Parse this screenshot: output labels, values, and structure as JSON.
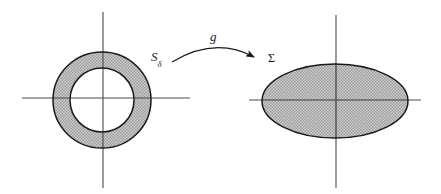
{
  "figure": {
    "kind": "mathematical-diagram",
    "background_color": "#ffffff",
    "width": 441,
    "height": 194,
    "caption_text": "",
    "labels": {
      "source_symbol": "S",
      "source_subscript": "δ",
      "map_symbol": "g",
      "target_symbol": "Σ"
    },
    "colors": {
      "stroke": "#1a1a1a",
      "axis": "#4a4a4a",
      "fill_gray": "#b4b4b4",
      "fill_gray_light": "#c9c9c9",
      "hatch_dot": "#8c8c8c"
    },
    "left_shape": {
      "name": "annulus",
      "center_x": 102,
      "center_y": 100,
      "outer_rx": 49,
      "outer_ry": 48,
      "inner_rx": 32,
      "inner_ry": 32,
      "filled": true,
      "inner_filled": false
    },
    "left_axes": {
      "horizontal": {
        "x1": 22,
        "y1": 98,
        "x2": 190,
        "y2": 98
      },
      "vertical": {
        "x1": 103,
        "y1": 12,
        "x2": 103,
        "y2": 188
      }
    },
    "right_shape": {
      "name": "ellipse",
      "center_x": 335,
      "center_y": 101,
      "rx": 73,
      "ry": 37,
      "filled": true
    },
    "right_axes": {
      "horizontal": {
        "x1": 249,
        "y1": 100,
        "x2": 421,
        "y2": 100
      },
      "vertical": {
        "x1": 336,
        "y1": 15,
        "x2": 336,
        "y2": 188
      }
    },
    "arrow": {
      "name": "mapping-arrow",
      "start_x": 172,
      "start_y": 62,
      "control_x": 215,
      "control_y": 36,
      "end_x": 258,
      "end_y": 60,
      "arrowhead": "solid-triangle"
    }
  }
}
